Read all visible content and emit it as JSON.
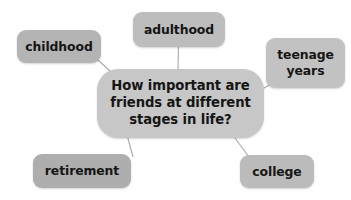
{
  "diagram": {
    "type": "mind-map",
    "background_color": "#ffffff",
    "central": {
      "id": "central-question",
      "text": "How important are\nfriends at different\nstages in life?",
      "fill_color": "#c7c7c7",
      "text_color": "#151515"
    },
    "branches": [
      {
        "id": "childhood",
        "label": "childhood",
        "fill_color": "#b4b4b4",
        "position": "top-left"
      },
      {
        "id": "adulthood",
        "label": "adulthood",
        "fill_color": "#bdbdbd",
        "position": "top-center"
      },
      {
        "id": "teenage-years",
        "label": "teenage\nyears",
        "fill_color": "#c2c2c2",
        "position": "right"
      },
      {
        "id": "retirement",
        "label": "retirement",
        "fill_color": "#aeaeae",
        "position": "bottom-left"
      },
      {
        "id": "college",
        "label": "college",
        "fill_color": "#bbbbbb",
        "position": "bottom-right"
      }
    ],
    "connector_color": "#aaaaaa"
  }
}
